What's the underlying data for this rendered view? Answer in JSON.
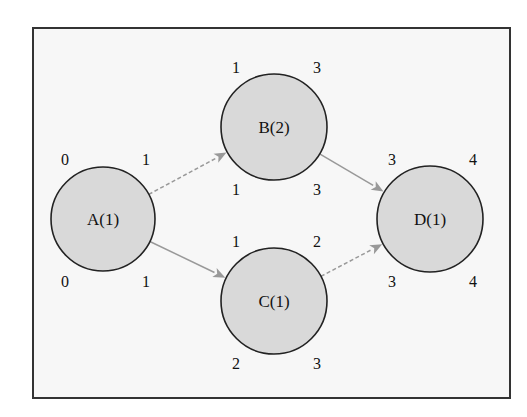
{
  "diagram": {
    "type": "activity-network",
    "nodes": [
      {
        "id": "A",
        "label": "A(1)",
        "cx": 103,
        "cy": 219,
        "r": 52,
        "times": {
          "top_left": "0",
          "top_right": "1",
          "bottom_left": "0",
          "bottom_right": "1"
        }
      },
      {
        "id": "B",
        "label": "B(2)",
        "cx": 274,
        "cy": 127,
        "r": 53,
        "times": {
          "top_left": "1",
          "top_right": "3",
          "bottom_left": "1",
          "bottom_right": "3"
        }
      },
      {
        "id": "C",
        "label": "C(1)",
        "cx": 274,
        "cy": 301,
        "r": 53,
        "times": {
          "top_left": "1",
          "top_right": "2",
          "bottom_left": "2",
          "bottom_right": "3"
        }
      },
      {
        "id": "D",
        "label": "D(1)",
        "cx": 430,
        "cy": 219,
        "r": 53,
        "times": {
          "top_left": "3",
          "top_right": "4",
          "bottom_left": "3",
          "bottom_right": "4"
        }
      }
    ],
    "edges": [
      {
        "from": "A",
        "to": "B",
        "style": "dashed"
      },
      {
        "from": "A",
        "to": "C",
        "style": "solid"
      },
      {
        "from": "B",
        "to": "D",
        "style": "solid"
      },
      {
        "from": "C",
        "to": "D",
        "style": "dashed"
      }
    ],
    "colors": {
      "node_fill": "#d9d9d9",
      "node_stroke": "#222222",
      "edge": "#999999",
      "frame_fill": "#f7f7f7",
      "frame_stroke": "#333333"
    }
  }
}
